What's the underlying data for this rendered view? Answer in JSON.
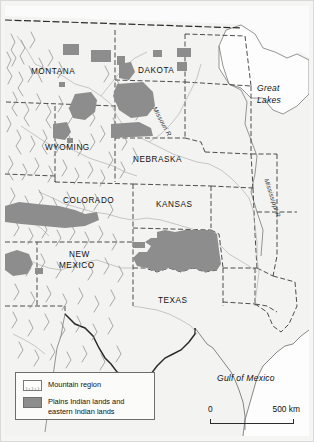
{
  "map": {
    "title": "Plains Indian lands and eastern Indian lands",
    "colors": {
      "land": "#f3f3f1",
      "water": "#fdfdfd",
      "indian_lands": "#8d8d8d",
      "mountain_line": "#9a9a9a",
      "border": "#2b2b2b",
      "state_border": "#3a3a3a"
    },
    "state_labels": [
      {
        "name": "MONTANA",
        "x": 30,
        "y": 67
      },
      {
        "name": "DAKOTA",
        "x": 137,
        "y": 66
      },
      {
        "name": "WYOMING",
        "x": 44,
        "y": 143
      },
      {
        "name": "NEBRASKA",
        "x": 132,
        "y": 155
      },
      {
        "name": "COLORADO",
        "x": 62,
        "y": 196
      },
      {
        "name": "KANSAS",
        "x": 155,
        "y": 200
      },
      {
        "name": "NEW",
        "x": 68,
        "y": 250
      },
      {
        "name": "MEXICO",
        "x": 58,
        "y": 261
      },
      {
        "name": "TEXAS",
        "x": 157,
        "y": 296
      }
    ],
    "water_labels": [
      {
        "name": "Great",
        "x": 256,
        "y": 84
      },
      {
        "name": "Lakes",
        "x": 256,
        "y": 96
      },
      {
        "name": "Gulf of Mexico",
        "x": 220,
        "y": 373
      }
    ],
    "river_labels": [
      {
        "name": "Missouri R.",
        "x": 158,
        "y": 104,
        "rotate": 62
      },
      {
        "name": "Mississippi R.",
        "x": 268,
        "y": 176,
        "rotate": 72
      }
    ]
  },
  "legend": {
    "items": [
      {
        "swatch": "mountain-region-swatch",
        "label": "Mountain region"
      },
      {
        "swatch": "indian-lands-swatch",
        "label": "Plains Indian lands and"
      },
      {
        "swatch": null,
        "label": "eastern Indian lands"
      }
    ]
  },
  "scale": {
    "min_label": "0",
    "max_label": "500 km"
  }
}
